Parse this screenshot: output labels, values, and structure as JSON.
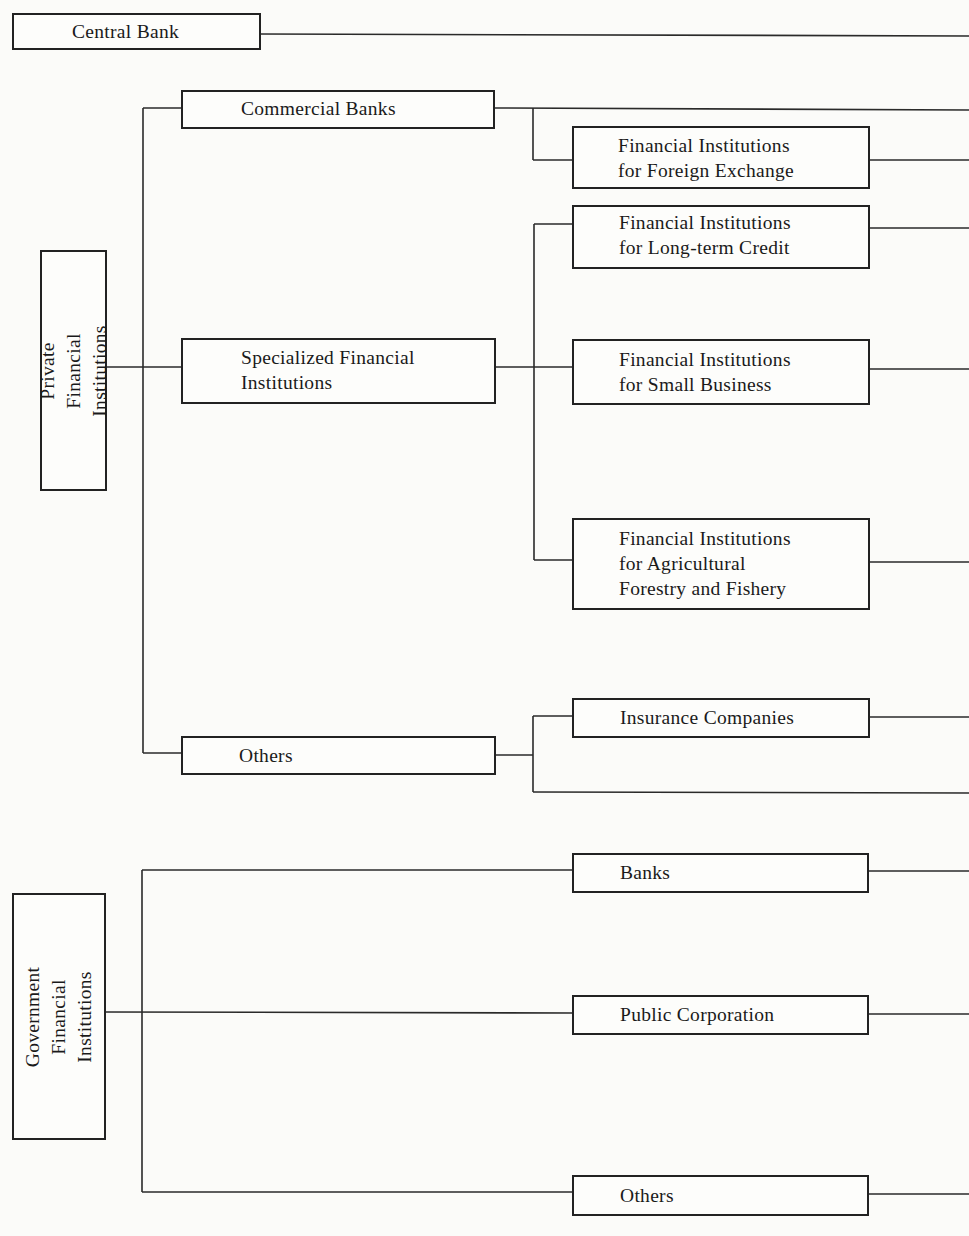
{
  "diagram": {
    "central_bank": {
      "label": "Central Bank"
    },
    "private": {
      "label": "Private Financial\nInstitutions",
      "commercial_banks": {
        "label": "Commercial Banks"
      },
      "foreign_exchange": {
        "label": "Financial Institutions\nfor Foreign Exchange"
      },
      "specialized": {
        "label": "Specialized Financial\nInstitutions"
      },
      "long_term_credit": {
        "label": "Financial Institutions\nfor Long-term Credit"
      },
      "small_business": {
        "label": "Financial Institutions\nfor Small Business"
      },
      "agricultural": {
        "label": "Financial Institutions\nfor Agricultural\nForestry and Fishery"
      },
      "others": {
        "label": "Others"
      },
      "insurance": {
        "label": "Insurance Companies"
      }
    },
    "government": {
      "label": "Government\nFinancial\nInstitutions",
      "banks": {
        "label": "Banks"
      },
      "public_corporation": {
        "label": "Public Corporation"
      },
      "others": {
        "label": "Others"
      }
    }
  }
}
